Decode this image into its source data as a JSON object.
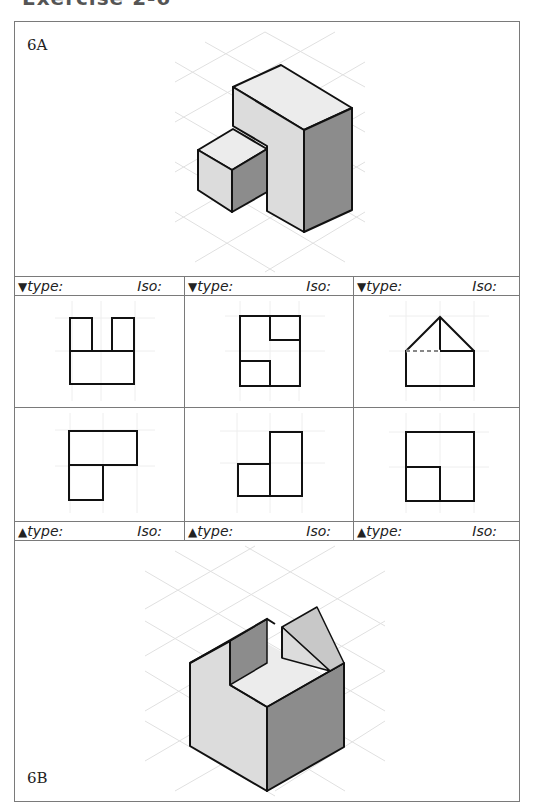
{
  "page": {
    "heading": "Exercise 2-6"
  },
  "panels": {
    "top": {
      "label": "6A",
      "figure": "isometric-object-6a"
    },
    "bottom": {
      "label": "6B",
      "figure": "isometric-object-6b"
    }
  },
  "label_rows": {
    "top": [
      {
        "arrow": "▼",
        "type_label": "type:",
        "iso_label": "Iso:"
      },
      {
        "arrow": "▼",
        "type_label": "type:",
        "iso_label": "Iso:"
      },
      {
        "arrow": "▼",
        "type_label": "type:",
        "iso_label": "Iso:"
      }
    ],
    "bottom": [
      {
        "arrow": "▲",
        "type_label": "type:",
        "iso_label": "Iso:"
      },
      {
        "arrow": "▲",
        "type_label": "type:",
        "iso_label": "Iso:"
      },
      {
        "arrow": "▲",
        "type_label": "type:",
        "iso_label": "Iso:"
      }
    ]
  },
  "views": {
    "row1": [
      {
        "name": "view-u-shape"
      },
      {
        "name": "view-s-square"
      },
      {
        "name": "view-house-pentagon"
      }
    ],
    "row2": [
      {
        "name": "view-l-shape-down"
      },
      {
        "name": "view-step-right"
      },
      {
        "name": "view-square-inner-corner"
      }
    ]
  },
  "colors": {
    "frame": "#7a7a7a",
    "line": "#111111",
    "grid": "#dddddd",
    "face_light": "#ececec",
    "face_mid": "#dcdcdc",
    "face_dark": "#8c8c8c"
  }
}
